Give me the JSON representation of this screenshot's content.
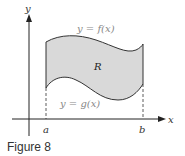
{
  "figure": {
    "caption": "Figure 8",
    "labels": {
      "y_axis": "y",
      "x_axis": "x",
      "upper_curve": "y = f(x)",
      "lower_curve": "y = g(x)",
      "region": "R",
      "left_bound": "a",
      "right_bound": "b"
    },
    "colors": {
      "fill": "#d9d9d9",
      "curve": "#333333",
      "axis": "#222222",
      "label_gray": "#888888"
    }
  }
}
